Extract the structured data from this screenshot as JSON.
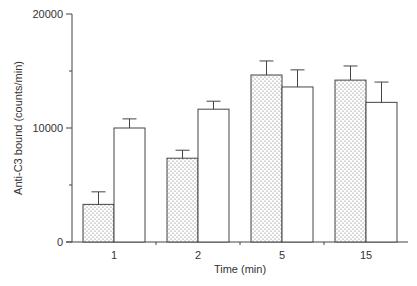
{
  "chart_data": {
    "type": "bar",
    "title": "",
    "xlabel": "Time (min)",
    "ylabel": "Anti-C3 bound (counts/min)",
    "categories": [
      "1",
      "2",
      "5",
      "15"
    ],
    "series": [
      {
        "name": "dotted",
        "pattern": "stipple",
        "values": [
          3300,
          7350,
          14650,
          14200
        ],
        "errors": [
          1100,
          700,
          1230,
          1240
        ]
      },
      {
        "name": "open",
        "pattern": "open",
        "values": [
          10000,
          11650,
          13600,
          12250
        ],
        "errors": [
          800,
          700,
          1500,
          1780
        ]
      }
    ],
    "ylim": [
      0,
      20000
    ],
    "yticks": [
      0,
      10000,
      20000
    ],
    "yticks_minor": [
      5000,
      15000
    ],
    "ytick_labels": [
      "0",
      "10000",
      "20000"
    ],
    "grid": false,
    "legend": null
  }
}
